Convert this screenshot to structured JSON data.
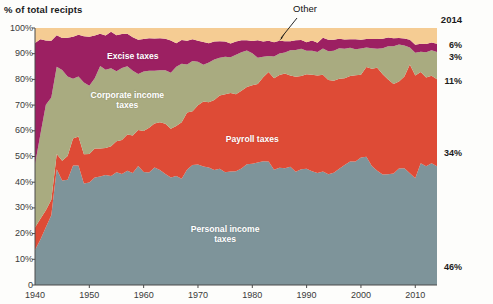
{
  "chart_data": {
    "type": "area",
    "title": "% of total recipts",
    "xlabel": "",
    "ylabel": "% of total recipts",
    "xlim": [
      1940,
      2014
    ],
    "ylim": [
      0,
      100
    ],
    "grid": false,
    "stacked": true,
    "legend_position": "in-plot-labels",
    "y_ticks": [
      "0",
      "10%",
      "20%",
      "30%",
      "40%",
      "50%",
      "60%",
      "70%",
      "80%",
      "90%",
      "100%"
    ],
    "y_tick_values": [
      0,
      10,
      20,
      30,
      40,
      50,
      60,
      70,
      80,
      90,
      100
    ],
    "x_ticks": [
      "1940",
      "1950",
      "1960",
      "1970",
      "1980",
      "1990",
      "2000",
      "2010"
    ],
    "x_tick_values": [
      1940,
      1950,
      1960,
      1970,
      1980,
      1990,
      2000,
      2010
    ],
    "end_year_label": "2014",
    "annotation": {
      "text": "Other",
      "x": 1988,
      "y": 99,
      "arrow_to_x": 1982,
      "arrow_to_y": 96.5
    },
    "x": [
      1940,
      1941,
      1942,
      1943,
      1944,
      1945,
      1946,
      1947,
      1948,
      1949,
      1950,
      1951,
      1952,
      1953,
      1954,
      1955,
      1956,
      1957,
      1958,
      1959,
      1960,
      1961,
      1962,
      1963,
      1964,
      1965,
      1966,
      1967,
      1968,
      1969,
      1970,
      1971,
      1972,
      1973,
      1974,
      1975,
      1976,
      1977,
      1978,
      1979,
      1980,
      1981,
      1982,
      1983,
      1984,
      1985,
      1986,
      1987,
      1988,
      1989,
      1990,
      1991,
      1992,
      1993,
      1994,
      1995,
      1996,
      1997,
      1998,
      1999,
      2000,
      2001,
      2002,
      2003,
      2004,
      2005,
      2006,
      2007,
      2008,
      2009,
      2010,
      2011,
      2012,
      2013,
      2014
    ],
    "series": [
      {
        "name": "Personal income taxes",
        "label": "Personal income\ntaxes",
        "color": "#7e949a",
        "label_x": 1975,
        "label_y": 20,
        "end_value": "46%",
        "values": [
          13.6,
          17.7,
          22.5,
          27.1,
          45.0,
          40.7,
          41.0,
          46.5,
          46.5,
          39.5,
          39.9,
          41.8,
          42.2,
          42.8,
          42.4,
          43.9,
          43.2,
          44.5,
          43.6,
          46.3,
          44.0,
          43.8,
          45.7,
          44.7,
          43.2,
          41.8,
          42.4,
          41.3,
          44.9,
          46.7,
          46.9,
          46.1,
          45.7,
          44.7,
          45.2,
          43.9,
          44.2,
          44.3,
          45.3,
          47.0,
          47.2,
          47.7,
          48.2,
          48.1,
          44.8,
          45.6,
          45.4,
          46.0,
          44.1,
          45.0,
          45.2,
          44.3,
          43.6,
          44.2,
          43.1,
          43.7,
          45.2,
          46.7,
          48.1,
          48.1,
          49.6,
          49.9,
          46.3,
          44.5,
          43.0,
          43.1,
          43.4,
          45.3,
          45.4,
          43.5,
          41.5,
          47.4,
          46.2,
          47.4,
          46.2
        ]
      },
      {
        "name": "Payroll taxes",
        "label": "Payroll taxes",
        "color": "#de4b36",
        "label_x": 1980,
        "label_y": 57,
        "end_value": "34%",
        "values": [
          8.8,
          8.1,
          6.6,
          6.1,
          6.0,
          7.6,
          9.2,
          10.5,
          11.3,
          11.4,
          11.1,
          11.3,
          10.9,
          10.5,
          11.6,
          12.0,
          13.2,
          14.1,
          14.6,
          14.0,
          15.9,
          17.4,
          17.1,
          18.6,
          19.5,
          19.0,
          19.5,
          22.0,
          22.2,
          20.9,
          23.0,
          25.3,
          25.4,
          27.3,
          28.5,
          30.3,
          30.5,
          29.9,
          30.3,
          30.0,
          30.5,
          30.5,
          32.6,
          34.8,
          35.6,
          36.1,
          36.9,
          35.5,
          36.9,
          36.3,
          36.8,
          37.5,
          37.9,
          37.6,
          36.7,
          35.8,
          35.1,
          33.7,
          33.2,
          33.5,
          32.2,
          34.9,
          37.8,
          40.0,
          39.0,
          36.9,
          34.8,
          33.9,
          35.7,
          42.3,
          40.0,
          35.5,
          34.5,
          34.0,
          33.9
        ]
      },
      {
        "name": "Corporate income taxes",
        "label": "Corporate income\ntaxes",
        "color": "#a9ab80",
        "label_x": 1957,
        "label_y": 72,
        "end_value": "11%",
        "values": [
          24.5,
          33.0,
          41.0,
          39.8,
          33.9,
          35.4,
          30.9,
          23.3,
          23.3,
          27.9,
          26.5,
          27.3,
          32.1,
          30.5,
          30.3,
          27.3,
          28.0,
          26.5,
          25.2,
          21.8,
          23.2,
          22.2,
          20.6,
          20.3,
          20.9,
          21.8,
          23.0,
          22.8,
          18.7,
          19.6,
          17.0,
          14.3,
          15.5,
          15.7,
          14.7,
          14.6,
          13.9,
          15.4,
          15.0,
          14.2,
          12.5,
          10.2,
          8.0,
          6.2,
          8.5,
          8.4,
          8.2,
          9.8,
          10.4,
          10.6,
          9.1,
          9.3,
          9.2,
          10.2,
          11.2,
          11.6,
          11.8,
          11.5,
          11.0,
          10.1,
          10.2,
          7.6,
          8.0,
          7.4,
          10.1,
          12.9,
          14.7,
          14.4,
          12.1,
          6.6,
          8.9,
          7.9,
          9.9,
          9.9,
          10.6
        ]
      },
      {
        "name": "Excise taxes",
        "label": "Excise taxes",
        "color": "#9c2062",
        "label_x": 1958,
        "label_y": 89,
        "end_value": "3%",
        "values": [
          47.3,
          36.8,
          25.0,
          22.0,
          12.3,
          12.4,
          15.1,
          16.3,
          16.3,
          18.0,
          19.1,
          16.7,
          12.6,
          13.3,
          14.2,
          14.0,
          13.3,
          12.7,
          13.0,
          13.3,
          12.6,
          12.6,
          12.5,
          12.4,
          12.2,
          12.5,
          9.2,
          9.2,
          9.2,
          8.4,
          8.1,
          8.9,
          7.5,
          7.0,
          6.4,
          5.9,
          5.4,
          5.1,
          4.6,
          4.0,
          4.7,
          6.8,
          5.9,
          5.9,
          5.6,
          4.9,
          4.3,
          3.5,
          3.8,
          3.4,
          3.4,
          4.0,
          3.6,
          4.2,
          4.4,
          4.3,
          3.7,
          3.6,
          3.3,
          3.9,
          3.4,
          3.3,
          3.6,
          3.8,
          3.7,
          3.4,
          3.1,
          2.5,
          2.7,
          3.0,
          3.1,
          3.1,
          3.2,
          3.1,
          3.2
        ]
      },
      {
        "name": "Other",
        "label": "",
        "color": "#f5cc93",
        "label_x": null,
        "label_y": null,
        "end_value": "6%",
        "values": [
          5.8,
          4.4,
          4.9,
          5.0,
          2.8,
          3.9,
          3.8,
          3.4,
          2.6,
          3.2,
          3.4,
          2.9,
          2.2,
          2.9,
          1.5,
          2.8,
          2.3,
          2.2,
          3.6,
          4.6,
          4.3,
          4.0,
          4.1,
          4.0,
          4.2,
          4.9,
          5.9,
          4.7,
          5.0,
          4.4,
          5.0,
          5.4,
          5.9,
          5.3,
          5.2,
          5.3,
          6.0,
          5.3,
          4.8,
          4.8,
          5.1,
          4.8,
          5.3,
          5.0,
          5.5,
          5.0,
          5.2,
          5.2,
          4.8,
          4.7,
          5.5,
          4.9,
          5.7,
          3.8,
          4.6,
          4.6,
          4.2,
          4.5,
          4.4,
          4.4,
          4.6,
          4.3,
          4.3,
          4.3,
          4.2,
          3.7,
          4.0,
          3.9,
          4.1,
          4.6,
          6.5,
          6.1,
          6.2,
          5.6,
          6.1
        ]
      }
    ]
  }
}
